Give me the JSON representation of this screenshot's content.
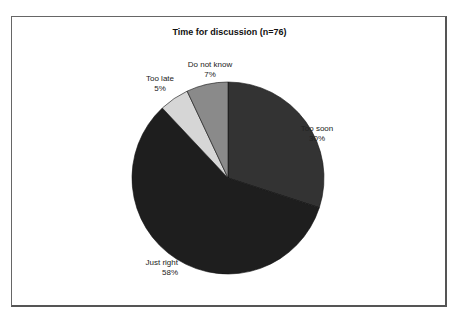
{
  "chart_data": {
    "type": "pie",
    "title": "Time for discussion (n=76)",
    "categories": [
      "Too soon",
      "Just right",
      "Too late",
      "Do not know"
    ],
    "values": [
      30,
      58,
      5,
      7
    ],
    "unit": "%",
    "colors": [
      "#333333",
      "#1e1e1e",
      "#d6d6d6",
      "#8a8a8a"
    ],
    "start_angle": "12 o'clock",
    "direction": "clockwise",
    "legend": "none (data labels)"
  },
  "labels": {
    "too_soon": {
      "name": "Too soon",
      "pct": "30%"
    },
    "just_right": {
      "name": "Just right",
      "pct": "58%"
    },
    "too_late": {
      "name": "Too late",
      "pct": "5%"
    },
    "do_not_know": {
      "name": "Do not know",
      "pct": "7%"
    }
  }
}
